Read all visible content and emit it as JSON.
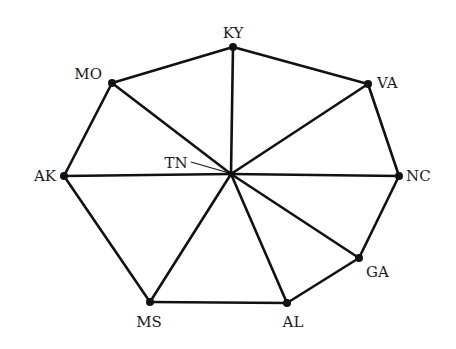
{
  "diagram": {
    "type": "graph",
    "nodes": [
      {
        "id": "KY",
        "label": "KY",
        "x": 233,
        "y": 47,
        "lx": 233,
        "ly": 38,
        "anchor": "middle"
      },
      {
        "id": "MO",
        "label": "MO",
        "x": 112,
        "y": 83,
        "lx": 102,
        "ly": 79,
        "anchor": "end"
      },
      {
        "id": "VA",
        "label": "VA",
        "x": 368,
        "y": 84,
        "lx": 377,
        "ly": 88,
        "anchor": "start"
      },
      {
        "id": "AK",
        "label": "AK",
        "x": 64,
        "y": 176,
        "lx": 56,
        "ly": 181,
        "anchor": "end"
      },
      {
        "id": "NC",
        "label": "NC",
        "x": 399,
        "y": 176,
        "lx": 406,
        "ly": 181,
        "anchor": "start"
      },
      {
        "id": "TN",
        "label": "TN",
        "x": 231,
        "y": 174,
        "lx": 176,
        "ly": 168,
        "anchor": "middle"
      },
      {
        "id": "GA",
        "label": "GA",
        "x": 359,
        "y": 258,
        "lx": 366,
        "ly": 277,
        "anchor": "start"
      },
      {
        "id": "AL",
        "label": "AL",
        "x": 287,
        "y": 303,
        "lx": 293,
        "ly": 327,
        "anchor": "middle"
      },
      {
        "id": "MS",
        "label": "MS",
        "x": 150,
        "y": 302,
        "lx": 149,
        "ly": 327,
        "anchor": "middle"
      }
    ],
    "edges": [
      [
        "KY",
        "VA"
      ],
      [
        "VA",
        "NC"
      ],
      [
        "NC",
        "GA"
      ],
      [
        "GA",
        "AL"
      ],
      [
        "AL",
        "MS"
      ],
      [
        "MS",
        "AK"
      ],
      [
        "AK",
        "MO"
      ],
      [
        "MO",
        "KY"
      ],
      [
        "TN",
        "KY"
      ],
      [
        "TN",
        "MO"
      ],
      [
        "TN",
        "VA"
      ],
      [
        "TN",
        "AK"
      ],
      [
        "TN",
        "NC"
      ],
      [
        "TN",
        "GA"
      ],
      [
        "TN",
        "AL"
      ],
      [
        "TN",
        "MS"
      ]
    ],
    "tn_leader": {
      "x1": 191,
      "y1": 162,
      "x2": 229,
      "y2": 173
    }
  }
}
